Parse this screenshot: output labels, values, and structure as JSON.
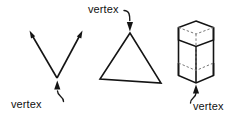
{
  "diagram": {
    "background_color": "#ffffff",
    "line_color": "#141414",
    "hidden_line_color": "#777777",
    "text_color": "#111111",
    "figures": [
      {
        "id": "angle",
        "name": "angle-figure",
        "shape": "angle-two-rays",
        "label": "vertex",
        "label_position": "below-left",
        "vertex_point": [
          57,
          78
        ],
        "ray_endpoints": [
          [
            30,
            33
          ],
          [
            82,
            33
          ]
        ],
        "arrowheads": 2
      },
      {
        "id": "triangle",
        "name": "triangle-figure",
        "shape": "triangle",
        "label": "vertex",
        "label_position": "above-left",
        "vertices": [
          [
            130,
            33
          ],
          [
            100,
            79
          ],
          [
            161,
            83
          ]
        ],
        "labeled_vertex": [
          130,
          33
        ]
      },
      {
        "id": "prism",
        "name": "hexagonal-prism-figure",
        "shape": "hexagonal-prism",
        "label": "vertex",
        "label_position": "below-right",
        "labeled_vertex": [
          196,
          84
        ],
        "hidden_edges": true
      }
    ],
    "labels": {
      "angle_label": "vertex",
      "triangle_label": "vertex",
      "prism_label": "vertex"
    }
  }
}
